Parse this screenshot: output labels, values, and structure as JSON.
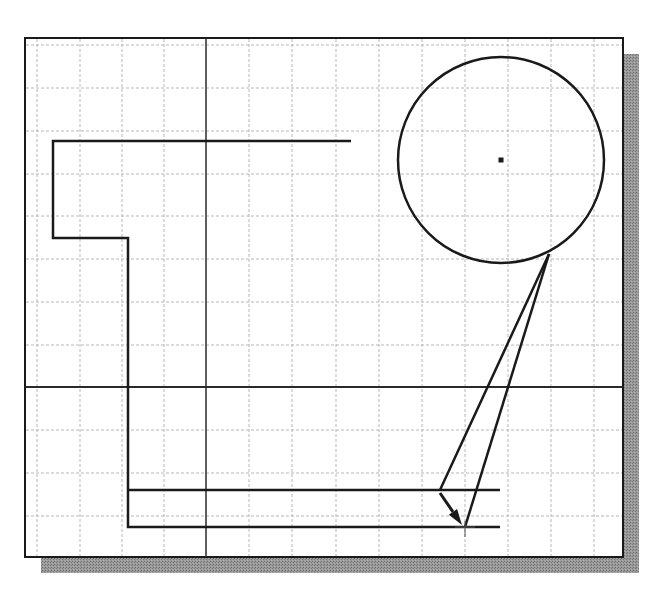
{
  "canvas": {
    "width": 662,
    "height": 595,
    "background": "#ffffff"
  },
  "viewport": {
    "frame": {
      "x": 25,
      "y": 38,
      "width": 598,
      "height": 519,
      "stroke": "#1a1a1a",
      "fill": "#ffffff"
    },
    "shadow": {
      "offset": 16,
      "color": "#8a8a8a"
    },
    "grid": {
      "color": "#b8b8b8",
      "dash": "3,2",
      "vertical_x": [
        37,
        80,
        122,
        164,
        249,
        292,
        336,
        379,
        422,
        465,
        508,
        551,
        594
      ],
      "horizontal_y": [
        45,
        88,
        131,
        174,
        216,
        259,
        302,
        345,
        430,
        473,
        516
      ]
    },
    "axes": {
      "vertical_x": 206,
      "horizontal_y": 387,
      "color": "#2a2a2a"
    }
  },
  "geometry": {
    "line_color": "#1a1a1a",
    "polyline_outline": [
      [
        351,
        141
      ],
      [
        53,
        141
      ],
      [
        53,
        238
      ],
      [
        128,
        238
      ],
      [
        128,
        527
      ],
      [
        500,
        527
      ]
    ],
    "line_upper_horizontal": [
      [
        128,
        490
      ],
      [
        500,
        490
      ]
    ],
    "circle": {
      "cx": 501,
      "cy": 160,
      "r": 103,
      "center_mark_size": 5
    },
    "tangent_line_1": [
      [
        549,
        254
      ],
      [
        440,
        490
      ]
    ],
    "tangent_line_2": [
      [
        549,
        254
      ],
      [
        465,
        527
      ]
    ],
    "arrow": {
      "from": [
        440,
        493
      ],
      "to": [
        462,
        525
      ]
    },
    "cursor": {
      "x": 465,
      "y": 527,
      "size": 10
    }
  },
  "labels": {
    "viewport": "CAD drawing viewport",
    "circle": "circle",
    "cursor": "crosshair cursor"
  }
}
